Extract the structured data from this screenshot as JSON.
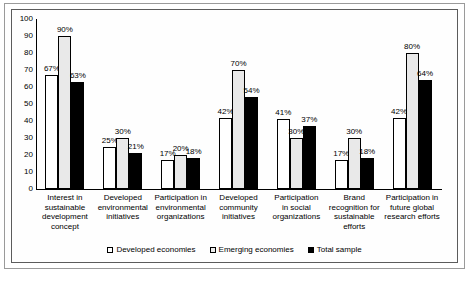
{
  "chart_data": {
    "type": "bar",
    "title": "",
    "xlabel": "",
    "ylabel": "",
    "ylim": [
      0,
      100
    ],
    "yticks": [
      100,
      90,
      80,
      70,
      60,
      50,
      40,
      30,
      20,
      10,
      0
    ],
    "grid": false,
    "legend_position": "bottom",
    "categories": [
      "Interest in sustainable development concept",
      "Developed environmental initiatives",
      "Participation in environmental organizations",
      "Developed community initiatives",
      "Participation in social organizations",
      "Brand recognition for sustainable efforts",
      "Participation in future global research efforts"
    ],
    "category_lines": [
      [
        "Interest in",
        "sustainable",
        "development",
        "concept"
      ],
      [
        "Developed",
        "environmental",
        "initiatives"
      ],
      [
        "Participation in",
        "environmental",
        "organizations"
      ],
      [
        "Developed",
        "community",
        "initiatives"
      ],
      [
        "Participation",
        "in social",
        "organizations"
      ],
      [
        "Brand",
        "recognition for",
        "sustainable",
        "efforts"
      ],
      [
        "Participation in",
        "future global",
        "research efforts"
      ]
    ],
    "series": [
      {
        "name": "Developed economies",
        "key": "developed",
        "color": "#ffffff",
        "values": [
          67,
          25,
          17,
          42,
          41,
          17,
          42
        ],
        "labels": [
          "67%",
          "25%",
          "17%",
          "42%",
          "41%",
          "17%",
          "42%"
        ]
      },
      {
        "name": "Emerging economies",
        "key": "emerging",
        "color": "#e9e9e9",
        "values": [
          90,
          30,
          20,
          70,
          30,
          30,
          80
        ],
        "labels": [
          "90%",
          "30%",
          "20%",
          "70%",
          "30%",
          "30%",
          "80%"
        ]
      },
      {
        "name": "Total sample",
        "key": "total",
        "color": "#000000",
        "values": [
          63,
          21,
          18,
          54,
          37,
          18,
          64
        ],
        "labels": [
          "63%",
          "21%",
          "18%",
          "54%",
          "37%",
          "18%",
          "64%"
        ]
      }
    ]
  },
  "legend": {
    "entries": [
      {
        "label": "Developed economies",
        "swatch": "white-square-icon"
      },
      {
        "label": "Emerging economies",
        "swatch": "gray-square-icon"
      },
      {
        "label": "Total sample",
        "swatch": "black-square-icon"
      }
    ]
  }
}
